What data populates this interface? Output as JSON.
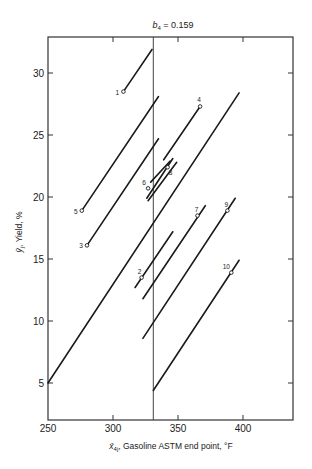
{
  "chart_data": {
    "type": "line",
    "title": "b4 = 0.159",
    "title_parts": {
      "var": "b",
      "sub": "4",
      "rest": " = 0.159"
    },
    "xlabel": "x̄4j, Gasoline ASTM end point, °F",
    "xlabel_parts": {
      "var": "x̄",
      "sub": "4j",
      "rest": ", Gasoline ASTM end point, °F"
    },
    "ylabel": "ȳj, Yield, %",
    "ylabel_parts": {
      "var": "ȳ",
      "sub": "j",
      "rest": ", Yield, %"
    },
    "xlim": [
      250,
      439
    ],
    "ylim": [
      2,
      33
    ],
    "xticks": [
      250,
      300,
      350,
      400
    ],
    "yticks": [
      5,
      10,
      15,
      20,
      25,
      30
    ],
    "grid": false,
    "legend": null,
    "reference_line": {
      "orientation": "vertical",
      "x": 331
    },
    "points": [
      {
        "label": "1",
        "x": 308,
        "y": 28.5
      },
      {
        "label": "2",
        "x": 322,
        "y": 13.5
      },
      {
        "label": "3",
        "x": 280,
        "y": 16.1
      },
      {
        "label": "4",
        "x": 367,
        "y": 27.3
      },
      {
        "label": "5",
        "x": 276,
        "y": 18.9
      },
      {
        "label": "6",
        "x": 327,
        "y": 20.7
      },
      {
        "label": "7",
        "x": 365,
        "y": 18.5
      },
      {
        "label": "8",
        "x": 342,
        "y": 22.4
      },
      {
        "label": "9",
        "x": 388,
        "y": 18.9
      },
      {
        "label": "10",
        "x": 391,
        "y": 13.9
      }
    ],
    "segments": [
      {
        "id": "line-1",
        "x1": 308,
        "y1": 28.5,
        "x2": 330,
        "y2": 31.9
      },
      {
        "id": "line-5",
        "x1": 276,
        "y1": 18.9,
        "x2": 335,
        "y2": 28.1
      },
      {
        "id": "line-3",
        "x1": 280,
        "y1": 16.1,
        "x2": 335,
        "y2": 24.7
      },
      {
        "id": "line-4",
        "x1": 339,
        "y1": 23.0,
        "x2": 367,
        "y2": 27.3
      },
      {
        "id": "line-a",
        "x1": 329,
        "y1": 21.2,
        "x2": 344,
        "y2": 22.9
      },
      {
        "id": "line-6",
        "x1": 326,
        "y1": 19.9,
        "x2": 346,
        "y2": 23.1
      },
      {
        "id": "line-8",
        "x1": 327,
        "y1": 19.7,
        "x2": 349,
        "y2": 22.8
      },
      {
        "id": "line-long",
        "x1": 250,
        "y1": 5.0,
        "x2": 397,
        "y2": 28.4
      },
      {
        "id": "line-2",
        "x1": 317,
        "y1": 12.7,
        "x2": 346,
        "y2": 17.2
      },
      {
        "id": "line-7",
        "x1": 323,
        "y1": 11.8,
        "x2": 371,
        "y2": 19.3
      },
      {
        "id": "line-9",
        "x1": 323,
        "y1": 8.6,
        "x2": 394,
        "y2": 19.9
      },
      {
        "id": "line-10",
        "x1": 331,
        "y1": 4.4,
        "x2": 397,
        "y2": 14.9
      }
    ]
  },
  "layout": {
    "plot_px": {
      "left": 48,
      "right": 293,
      "top": 37,
      "bottom": 420
    },
    "x_px_per_unit": 1.3,
    "y_px_at_30": 73,
    "y_px_per_unit": 12.4,
    "colors": {
      "ink": "#1a1a1a",
      "frame": "#333333",
      "ref": "#444444",
      "bg": "#ffffff"
    }
  }
}
